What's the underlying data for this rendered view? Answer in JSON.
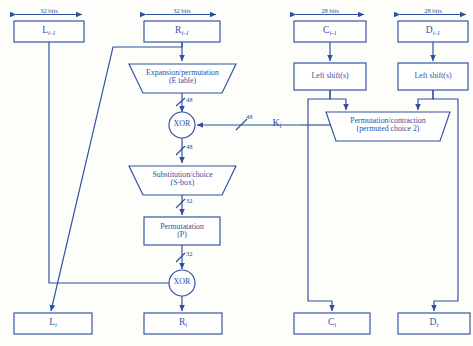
{
  "diagram": {
    "stroke_color": "#2f4f9f",
    "background_color": "#fdfdfa",
    "fill_color": "#ffffff"
  },
  "dimensions": [
    {
      "id": "dim-left-half",
      "label": "32 bits"
    },
    {
      "id": "dim-right-half",
      "label": "32 bits"
    },
    {
      "id": "dim-key-c",
      "label": "28 bits"
    },
    {
      "id": "dim-key-d",
      "label": "28 bits"
    }
  ],
  "inputs": {
    "left_half": {
      "base": "L",
      "sub": "i-1"
    },
    "right_half": {
      "base": "R",
      "sub": "i-1"
    },
    "key_c": {
      "base": "C",
      "sub": "i-1"
    },
    "key_d": {
      "base": "D",
      "sub": "i-1"
    }
  },
  "outputs": {
    "left_half": {
      "base": "L",
      "sub": "i"
    },
    "right_half": {
      "base": "R",
      "sub": "i"
    },
    "key_c": {
      "base": "C",
      "sub": "i"
    },
    "key_d": {
      "base": "D",
      "sub": "i"
    }
  },
  "blocks": {
    "expansion": {
      "line1": "Expansion/permutation",
      "line2": "(E table)"
    },
    "substitution": {
      "line1": "Substitution/choice",
      "line2": "(S-box)"
    },
    "permutation": {
      "line1": "Permutatation",
      "line2": "(P)"
    },
    "key_permutation": {
      "line1": "Permutation/contraction",
      "line2": "(permuted choice 2)"
    },
    "left_shift_c": {
      "line1": "Left shift(s)"
    },
    "left_shift_d": {
      "line1": "Left shift(s)"
    }
  },
  "operators": {
    "xor_top": "XOR",
    "xor_bottom": "XOR"
  },
  "subkey": {
    "base": "K",
    "sub": "i"
  },
  "bit_widths": [
    {
      "id": "bits-after-expansion",
      "label": "48"
    },
    {
      "id": "bits-subkey",
      "label": "48"
    },
    {
      "id": "bits-after-xor",
      "label": "48"
    },
    {
      "id": "bits-after-sbox",
      "label": "32"
    },
    {
      "id": "bits-after-permutation",
      "label": "32"
    }
  ]
}
